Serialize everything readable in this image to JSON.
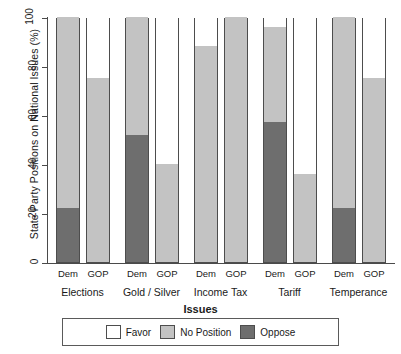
{
  "chart_data": {
    "type": "bar",
    "subtype": "stacked-percentage",
    "title": "",
    "xlabel": "Issues",
    "ylabel": "State Party Positions on National Issues (%)",
    "ylim": [
      0,
      100
    ],
    "yticks": [
      0,
      20,
      40,
      60,
      80,
      100
    ],
    "ytick_labels": [
      "0",
      "20",
      "40",
      "60",
      "80",
      "100"
    ],
    "grid": false,
    "legend_position": "bottom",
    "categories": [
      "Elections",
      "Gold / Silver",
      "Income Tax",
      "Tariff",
      "Temperance"
    ],
    "party_labels": [
      "Dem",
      "GOP"
    ],
    "series": [
      {
        "name": "Favor",
        "color": "#ffffff",
        "values_dem": [
          0,
          0,
          12,
          4,
          0
        ],
        "values_gop": [
          25,
          60,
          0,
          64,
          25
        ]
      },
      {
        "name": "No Position",
        "color": "#c3c3c3",
        "values_dem": [
          78,
          48,
          88,
          39,
          78
        ],
        "values_gop": [
          75,
          40,
          100,
          36,
          75
        ]
      },
      {
        "name": "Oppose",
        "color": "#6e6e6e",
        "values_dem": [
          22,
          52,
          0,
          57,
          22
        ],
        "values_gop": [
          0,
          0,
          0,
          0,
          0
        ]
      }
    ],
    "bars": [
      {
        "category": "Elections",
        "party": "Dem",
        "favor": 0,
        "no_position": 78,
        "oppose": 22
      },
      {
        "category": "Elections",
        "party": "GOP",
        "favor": 25,
        "no_position": 75,
        "oppose": 0
      },
      {
        "category": "Gold / Silver",
        "party": "Dem",
        "favor": 0,
        "no_position": 48,
        "oppose": 52
      },
      {
        "category": "Gold / Silver",
        "party": "GOP",
        "favor": 60,
        "no_position": 40,
        "oppose": 0
      },
      {
        "category": "Income Tax",
        "party": "Dem",
        "favor": 12,
        "no_position": 88,
        "oppose": 0
      },
      {
        "category": "Income Tax",
        "party": "GOP",
        "favor": 0,
        "no_position": 100,
        "oppose": 0
      },
      {
        "category": "Tariff",
        "party": "Dem",
        "favor": 4,
        "no_position": 39,
        "oppose": 57
      },
      {
        "category": "Tariff",
        "party": "GOP",
        "favor": 64,
        "no_position": 36,
        "oppose": 0
      },
      {
        "category": "Temperance",
        "party": "Dem",
        "favor": 0,
        "no_position": 78,
        "oppose": 22
      },
      {
        "category": "Temperance",
        "party": "GOP",
        "favor": 25,
        "no_position": 75,
        "oppose": 0
      }
    ]
  },
  "legend": {
    "items": [
      {
        "label": "Favor",
        "color": "#ffffff"
      },
      {
        "label": "No Position",
        "color": "#c3c3c3"
      },
      {
        "label": "Oppose",
        "color": "#6e6e6e"
      }
    ]
  }
}
